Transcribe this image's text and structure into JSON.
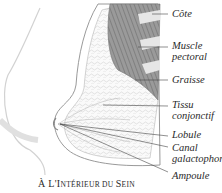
{
  "diagram": {
    "title_prefix": "À L'I",
    "title_rest1": "NTÉRIEUR DU ",
    "title_s": "S",
    "title_rest2": "EIN",
    "title_full": "À L'Intérieur du Sein",
    "labels": [
      {
        "id": "cote",
        "lines": [
          "Côte"
        ]
      },
      {
        "id": "muscle-pectoral",
        "lines": [
          "Muscle",
          "pectoral"
        ]
      },
      {
        "id": "graisse",
        "lines": [
          "Graisse"
        ]
      },
      {
        "id": "tissu-conjonctif",
        "lines": [
          "Tissu",
          "conjonctif"
        ]
      },
      {
        "id": "lobule",
        "lines": [
          "Lobule"
        ]
      },
      {
        "id": "canal-galactophore",
        "lines": [
          "Canal",
          "galactophore"
        ]
      },
      {
        "id": "ampoule",
        "lines": [
          "Ampoule"
        ]
      }
    ],
    "colors": {
      "muscle": "#8a8a8a",
      "rib": "#d8d8d8",
      "fat": "#f2f2f2",
      "outline": "#9a9a9a",
      "leader": "#444444",
      "text": "#2a2a2a"
    }
  }
}
